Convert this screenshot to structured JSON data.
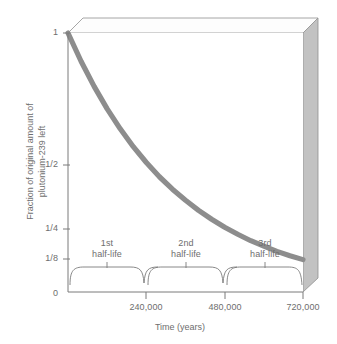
{
  "chart_data": {
    "type": "line",
    "title": "",
    "xlabel": "Time (years)",
    "ylabel_line1": "Fraction of original amount of",
    "ylabel_line2": "plutonium-239 left",
    "xlim": [
      0,
      720000
    ],
    "ylim": [
      0,
      1
    ],
    "grid": false,
    "legend": "none",
    "xticks": [
      {
        "value": 240000,
        "label": "240,000"
      },
      {
        "value": 480000,
        "label": "480,000"
      },
      {
        "value": 720000,
        "label": "720,000"
      }
    ],
    "yticks": [
      {
        "value": 1,
        "label": "1"
      },
      {
        "value": 0.5,
        "label": "1/2"
      },
      {
        "value": 0.25,
        "label": "1/4"
      },
      {
        "value": 0.125,
        "label": "1/8"
      },
      {
        "value": 0,
        "label": "0"
      }
    ],
    "series": [
      {
        "name": "plutonium-239 remaining fraction",
        "color": "#8d8d8d",
        "x": [
          0,
          40000,
          80000,
          120000,
          160000,
          200000,
          240000,
          280000,
          320000,
          360000,
          400000,
          440000,
          480000,
          520000,
          560000,
          600000,
          640000,
          680000,
          720000
        ],
        "y": [
          1.0,
          0.891,
          0.794,
          0.707,
          0.63,
          0.561,
          0.5,
          0.445,
          0.397,
          0.354,
          0.315,
          0.281,
          0.25,
          0.223,
          0.198,
          0.177,
          0.157,
          0.14,
          0.125
        ]
      }
    ],
    "annotations": [
      {
        "name": "1st-half-life",
        "line1": "1st",
        "line2": "half-life",
        "x_start": 0,
        "x_end": 240000
      },
      {
        "name": "2nd-half-life",
        "line1": "2nd",
        "line2": "half-life",
        "x_start": 240000,
        "x_end": 480000
      },
      {
        "name": "3rd-half-life",
        "line1": "3rd",
        "line2": "half-life",
        "x_start": 480000,
        "x_end": 720000
      }
    ],
    "colors": {
      "curve": "#8d8d8d",
      "axis": "#7a7a7a",
      "text": "#6e6e6e",
      "box_face": "#ffffff",
      "box_side": "#b9b9b9",
      "box_top": "#fbfbfb"
    }
  }
}
